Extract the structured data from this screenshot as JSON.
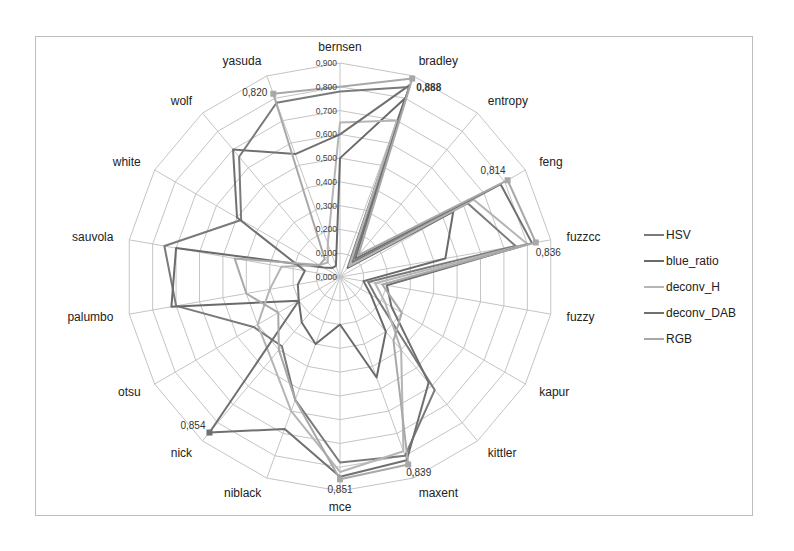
{
  "chart_data": {
    "type": "radar",
    "title": "",
    "categories": [
      "bernsen",
      "bradley",
      "entropy",
      "feng",
      "fuzzcc",
      "fuzzy",
      "kapur",
      "kittler",
      "maxent",
      "mce",
      "niblack",
      "nick",
      "otsu",
      "palumbo",
      "sauvola",
      "white",
      "wolf",
      "yasuda"
    ],
    "rlim": [
      0,
      0.9
    ],
    "ticks": [
      "0,000",
      "0,100",
      "0,200",
      "0,300",
      "0,400",
      "0,500",
      "0,600",
      "0,700",
      "0,800",
      "0,900"
    ],
    "grid": true,
    "legend_position": "right",
    "series": [
      {
        "name": "HSV",
        "color": "#7a7a7a",
        "width": 2,
        "values": [
          0.78,
          0.85,
          0.08,
          0.62,
          0.75,
          0.12,
          0.18,
          0.62,
          0.8,
          0.78,
          0.55,
          0.38,
          0.42,
          0.7,
          0.75,
          0.48,
          0.66,
          0.78
        ]
      },
      {
        "name": "blue_ratio",
        "color": "#6a6a6a",
        "width": 2,
        "values": [
          0.5,
          0.8,
          0.05,
          0.55,
          0.45,
          0.1,
          0.15,
          0.3,
          0.45,
          0.2,
          0.3,
          0.25,
          0.2,
          0.72,
          0.7,
          0.08,
          0.05,
          0.05
        ]
      },
      {
        "name": "deconv_H",
        "color": "#b5b5b5",
        "width": 2,
        "values": [
          0.65,
          0.7,
          0.06,
          0.65,
          0.8,
          0.15,
          0.22,
          0.4,
          0.78,
          0.82,
          0.6,
          0.45,
          0.4,
          0.3,
          0.25,
          0.1,
          0.08,
          0.15
        ]
      },
      {
        "name": "deconv_DAB",
        "color": "#707070",
        "width": 2,
        "values": [
          0.6,
          0.86,
          0.1,
          0.78,
          0.82,
          0.2,
          0.25,
          0.58,
          0.82,
          0.84,
          0.68,
          0.854,
          0.2,
          0.18,
          0.15,
          0.5,
          0.7,
          0.55
        ]
      },
      {
        "name": "RGB",
        "color": "#a8a8a8",
        "width": 2,
        "values": [
          0.8,
          0.888,
          0.12,
          0.814,
          0.836,
          0.18,
          0.3,
          0.35,
          0.839,
          0.851,
          0.55,
          0.4,
          0.3,
          0.4,
          0.45,
          0.1,
          0.1,
          0.82
        ]
      }
    ],
    "annotations": [
      {
        "category": "bradley",
        "label": "0,888",
        "bold": true
      },
      {
        "category": "feng",
        "label": "0,814"
      },
      {
        "category": "fuzzcc",
        "label": "0,836"
      },
      {
        "category": "maxent",
        "label": "0,839"
      },
      {
        "category": "mce",
        "label": "0,851"
      },
      {
        "category": "nick",
        "label": "0,854"
      },
      {
        "category": "yasuda",
        "label": "0,820"
      }
    ]
  },
  "legend": {
    "items": [
      {
        "label": "HSV",
        "color": "#7a7a7a"
      },
      {
        "label": "blue_ratio",
        "color": "#6a6a6a"
      },
      {
        "label": "deconv_H",
        "color": "#b5b5b5"
      },
      {
        "label": "deconv_DAB",
        "color": "#707070"
      },
      {
        "label": "RGB",
        "color": "#a8a8a8"
      }
    ]
  }
}
